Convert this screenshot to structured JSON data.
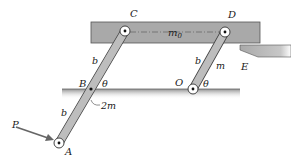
{
  "figure": {
    "type": "mechanism diagram",
    "colors": {
      "plate": "#a9a9a9",
      "plate_edge": "#555555",
      "bar": "#bdbdbd",
      "bar_edge": "#444444",
      "ground": "#b0b0b0",
      "text": "#1a1a1a",
      "arrow": "#666666"
    },
    "labels": {
      "C": "C",
      "D": "D",
      "m0": "m",
      "m0_sub": "0",
      "E": "E",
      "b_upper_left": "b",
      "b_upper_right": "b",
      "m_right": "m",
      "B": "B",
      "theta_B": "θ",
      "O": "O",
      "theta_O": "θ",
      "b_lower": "b",
      "mass_2m": "2m",
      "P": "P",
      "A": "A"
    },
    "components": {
      "top_plate": {
        "mass": "m0"
      },
      "bar_CA": {
        "length_total": "2b",
        "mass": "2m",
        "pivot": "B"
      },
      "bar_DO": {
        "length": "b",
        "mass": "m",
        "pivot": "O"
      },
      "support": "E",
      "force": "P at A"
    }
  }
}
